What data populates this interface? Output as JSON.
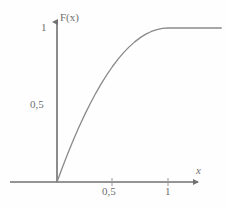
{
  "chart_data": {
    "type": "line",
    "title": "",
    "subtitle": "",
    "xlabel": "x",
    "ylabel": "F(x)",
    "xlim": [
      -0.42,
      1.48
    ],
    "ylim": [
      -0.08,
      1.12
    ],
    "grid": false,
    "legend": null,
    "x_ticks": [
      {
        "value": 0.5,
        "label": "0,5"
      },
      {
        "value": 1,
        "label": "1"
      }
    ],
    "y_ticks": [
      {
        "value": 0.5,
        "label": "0,5"
      },
      {
        "value": 1,
        "label": "1"
      }
    ],
    "series": [
      {
        "name": "F(x)",
        "color": "#8a8a8a",
        "x": [
          0,
          0.05,
          0.1,
          0.15,
          0.2,
          0.25,
          0.3,
          0.35,
          0.4,
          0.45,
          0.5,
          0.55,
          0.6,
          0.65,
          0.7,
          0.75,
          0.8,
          0.85,
          0.9,
          0.95,
          1,
          1.1,
          1.2,
          1.3,
          1.4,
          1.48
        ],
        "y": [
          0,
          0.0975,
          0.19,
          0.2775,
          0.36,
          0.4375,
          0.51,
          0.5775,
          0.64,
          0.6975,
          0.75,
          0.7975,
          0.84,
          0.8775,
          0.91,
          0.9375,
          0.96,
          0.9775,
          0.99,
          0.9975,
          1,
          1,
          1,
          1,
          1,
          1
        ]
      }
    ],
    "annotations": []
  },
  "axes": {
    "y_title": "F(x)",
    "x_title": "x",
    "y_tick_top_label": "1",
    "y_tick_mid_label": "0,5",
    "x_tick_mid_label": "0,5",
    "x_tick_end_label": "1"
  },
  "colors": {
    "curve": "#8a8a8a",
    "axis": "#707070",
    "text": "#6f6f6f",
    "background": "#fefefe"
  }
}
